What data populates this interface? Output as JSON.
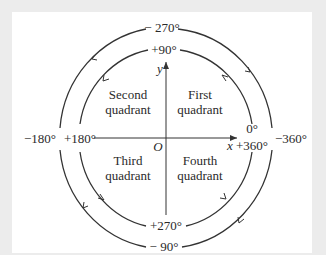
{
  "diagram": {
    "colors": {
      "background": "#ececec",
      "panel": "#ffffff",
      "stroke": "#333333",
      "text": "#2a2a2a"
    },
    "axes": {
      "x_label": "x",
      "y_label": "y",
      "origin_label": "O"
    },
    "quadrants": [
      {
        "name": "first",
        "line1": "First",
        "line2": "quadrant"
      },
      {
        "name": "second",
        "line1": "Second",
        "line2": "quadrant"
      },
      {
        "name": "third",
        "line1": "Third",
        "line2": "quadrant"
      },
      {
        "name": "fourth",
        "line1": "Fourth",
        "line2": "quadrant"
      }
    ],
    "inner_circle": {
      "direction": "counterclockwise",
      "labels": {
        "right_top": "0°",
        "right_bottom": "+360°",
        "top": "+90°",
        "left": "+180°",
        "bottom": "+270°"
      }
    },
    "outer_circle": {
      "direction": "clockwise",
      "labels": {
        "right": "−360°",
        "top": "− 270°",
        "left": "−180°",
        "bottom": "− 90°"
      }
    }
  }
}
